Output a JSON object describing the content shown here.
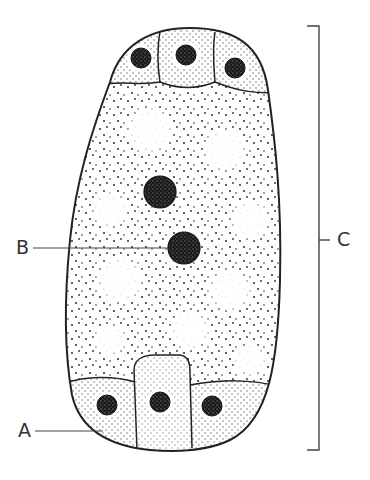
{
  "diagram": {
    "labels": {
      "A": "A",
      "B": "B",
      "C": "C"
    },
    "colors": {
      "outline": "#222222",
      "stipple": "#2a2a2a",
      "nucleus": "#1a1a1a",
      "leader_line": "#444444",
      "background": "#ffffff"
    },
    "structures": {
      "antipodal_cells": 3,
      "polar_nuclei": 2,
      "egg_apparatus_cells": 3
    }
  }
}
